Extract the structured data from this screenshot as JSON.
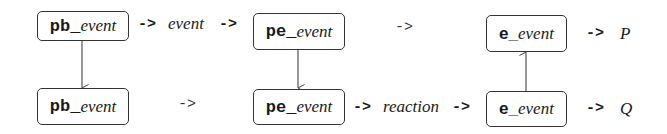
{
  "diagram": {
    "nodes": [
      {
        "id": "pb_top",
        "prefix": "pb_",
        "suffix": "event"
      },
      {
        "id": "pb_bottom",
        "prefix": "pb_",
        "suffix": "event"
      },
      {
        "id": "pe_top",
        "prefix": "pe_",
        "suffix": "event"
      },
      {
        "id": "pe_bottom",
        "prefix": "pe_",
        "suffix": "event"
      },
      {
        "id": "e_top",
        "prefix": "e_",
        "suffix": "event"
      },
      {
        "id": "e_bottom",
        "prefix": "e_",
        "suffix": "event"
      }
    ],
    "top_row": {
      "arrow1": "->",
      "label1": "event",
      "arrow2": "->",
      "arrow3": "->",
      "arrow_out": "->",
      "output": "P"
    },
    "bottom_row": {
      "arrow1": "->",
      "arrow2": "->",
      "label2": "reaction",
      "arrow3": "->",
      "arrow_out": "->",
      "output": "Q"
    },
    "vertical_edges": [
      {
        "from": "pb_top",
        "to": "pb_bottom",
        "direction": "down"
      },
      {
        "from": "pe_top",
        "to": "pe_bottom",
        "direction": "down"
      },
      {
        "from": "e_bottom",
        "to": "e_top",
        "direction": "up"
      }
    ]
  }
}
